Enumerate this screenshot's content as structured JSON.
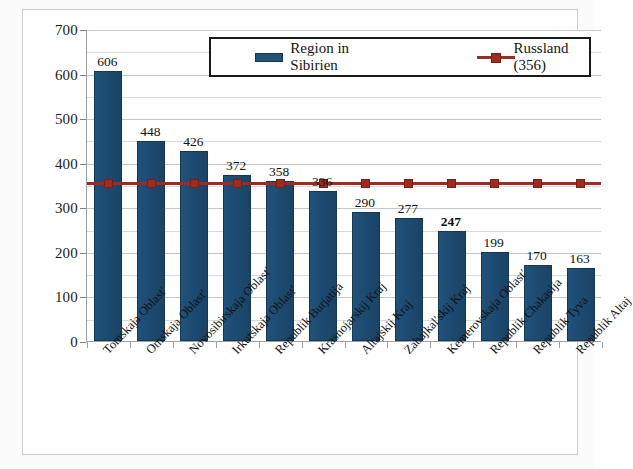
{
  "chart_data": {
    "type": "bar",
    "title": "",
    "xlabel": "",
    "ylabel": "",
    "ylim": [
      0,
      700
    ],
    "ytick_step": 100,
    "minor_gridlines": true,
    "grid": true,
    "legend_position": "top-center",
    "yticks": [
      "700",
      "600",
      "500",
      "400",
      "300",
      "200",
      "100",
      "0"
    ],
    "categories": [
      "Tomskaja Oblast′",
      "Omskaja Oblast′",
      "Novosibirskaja Oblast′",
      "Irkutskaja Oblast′",
      "Republik Burjatija",
      "Krasnojarskij Kraj",
      "Altajskij Kraj",
      "Zabajkal′skij Kraj",
      "Kemerovskaja Oblast′",
      "Republik Chakasija",
      "Republik Tyva",
      "Republik Altaj"
    ],
    "series": [
      {
        "name": "Region in Sibirien",
        "type": "bar",
        "color": "#20527c",
        "values": [
          606,
          448,
          426,
          372,
          358,
          336,
          290,
          277,
          247,
          199,
          170,
          163
        ],
        "data_labels": [
          "606",
          "448",
          "426",
          "372",
          "358",
          "336",
          "290",
          "277",
          "247",
          "199",
          "170",
          "163"
        ],
        "bold_labels": [
          false,
          false,
          false,
          false,
          false,
          false,
          false,
          false,
          true,
          false,
          false,
          false
        ]
      },
      {
        "name": "Russland (356)",
        "type": "line",
        "color": "#9c2b21",
        "constant_value": 356,
        "marker": "square"
      }
    ],
    "legend": [
      {
        "label": "Region in Sibirien",
        "color": "#20527c",
        "marker": "bar"
      },
      {
        "label": "Russland (356)",
        "color": "#9c2b21",
        "marker": "line-square"
      }
    ]
  }
}
